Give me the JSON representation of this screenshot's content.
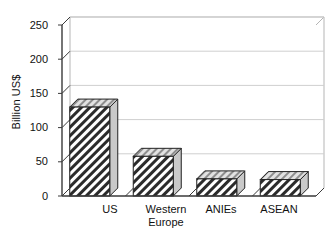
{
  "chart_data": {
    "type": "bar",
    "title": "",
    "subtitle": "",
    "xlabel": "",
    "ylabel": "Billion US$",
    "categories": [
      "US",
      "Western\nEurope",
      "ANIEs",
      "ASEAN"
    ],
    "values": [
      130,
      58,
      25,
      24
    ],
    "series": [
      {
        "name": "Value",
        "values": [
          130,
          58,
          25,
          24
        ]
      }
    ],
    "ylim": [
      0,
      250
    ],
    "ytick_labels": [
      "0",
      "50",
      "100",
      "150",
      "200",
      "250"
    ],
    "ytick_values": [
      0,
      50,
      100,
      150,
      200,
      250
    ],
    "grid": true,
    "grid_axis": "y",
    "legend": false,
    "legend_position": "none",
    "style": "3d-hatched-bars",
    "bar_fill": "diagonal-hatch",
    "annotations": []
  },
  "colors": {
    "background": "#ffffff",
    "axis_line": "#3a3a3a",
    "grid_line": "#cfcfcf",
    "frame_edge": "#b5b5b5",
    "bar_outline": "#222222",
    "bar_hatch": "#2b2b2b",
    "bar_face": "#ffffff",
    "bar_top": "#d6d6d6",
    "bar_side": "#c9c9c9",
    "text": "#111111"
  }
}
